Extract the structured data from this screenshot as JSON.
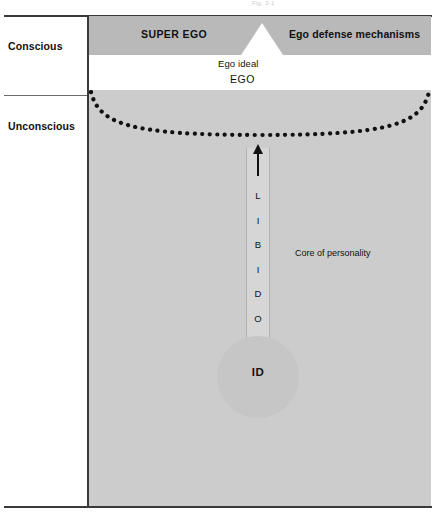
{
  "top_caption": "Fig. 2-1",
  "side_labels": {
    "conscious": "Conscious",
    "unconscious": "Unconscious"
  },
  "diagram": {
    "super_ego": "SUPER EGO",
    "ego_defense": "Ego defense mechanisms",
    "ego_ideal": "Ego ideal",
    "ego": "EGO",
    "preconscious_title": "Preconscious",
    "preconscious_dash": " — ",
    "preconscious_text": "Censors libidinal drives",
    "libido_letters": [
      "L",
      "I",
      "B",
      "I",
      "D",
      "O"
    ],
    "id_label": "ID",
    "core_of_personality": "Core of personality",
    "source_note": "(Source of libidinal forces; i. e., sexual instincts)",
    "subconscious_title": "Subconscious",
    "subconscious_text": " (breathing, digesting, metabolism)"
  },
  "colors": {
    "superego_band": "#b9b9b9",
    "ego_band": "#ffffff",
    "unconscious_band": "#cccccc",
    "shaft": "#d6d6d6",
    "id_circle": "#c6c6c6",
    "ink": "#111111",
    "frame": "#3a3a3a"
  }
}
